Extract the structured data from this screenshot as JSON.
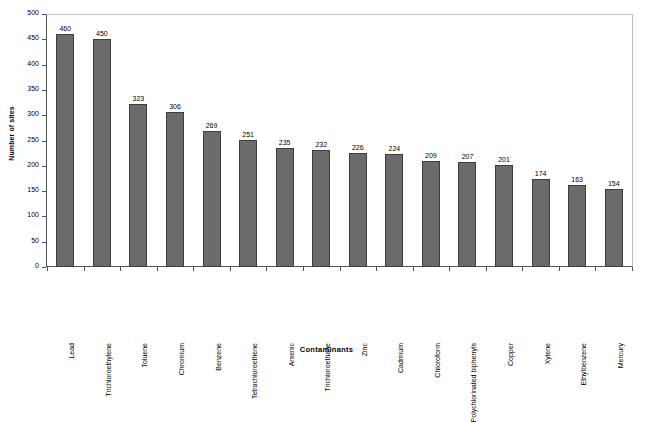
{
  "chart_data": {
    "type": "bar",
    "title": "",
    "xlabel": "Contaminants",
    "ylabel": "Number of sites",
    "ylim": [
      0,
      500
    ],
    "ytick_step": 50,
    "yticks": [
      500,
      450,
      400,
      350,
      300,
      250,
      200,
      150,
      100,
      50,
      0
    ],
    "grid": false,
    "legend": false,
    "bar_color": "#6b6b6b",
    "bar_edge_color": "#3d3d3d",
    "categories": [
      "Lead",
      "Trichloroethylene",
      "Toluene",
      "Chromium",
      "Benzene",
      "Tetrachloroethene",
      "Arsenic",
      "Trichloroethane",
      "Zinc",
      "Cadmium",
      "Chloroform",
      "Polychlorinated biphenyls",
      "Copper",
      "Xylene",
      "Ethylbenzene",
      "Mercury"
    ],
    "values": [
      460,
      450,
      323,
      306,
      269,
      251,
      235,
      232,
      226,
      224,
      209,
      207,
      201,
      174,
      163,
      154
    ],
    "data_labels": [
      "460",
      "450",
      "323",
      "306",
      "269",
      "251",
      "235",
      "232",
      "226",
      "224",
      "209",
      "207",
      "201",
      "174",
      "163",
      "154"
    ]
  }
}
